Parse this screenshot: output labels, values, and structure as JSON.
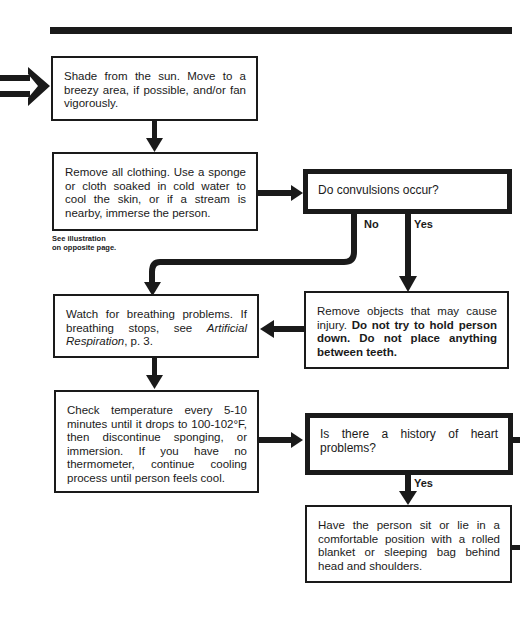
{
  "diagram": {
    "type": "flowchart",
    "topic": "Heat stroke first aid",
    "steps": {
      "shade": "Shade from the sun. Move to a breezy area, if possible, and/or fan vigorously.",
      "remove_clothing": "Remove all clothing. Use a sponge or cloth soaked in cold water to cool the skin, or if a stream is nearby, immerse the person.",
      "illustration_note_line1": "See illustration",
      "illustration_note_line2": "on opposite page.",
      "convulsions_question": "Do convulsions occur?",
      "no_label": "No",
      "yes_label": "Yes",
      "watch_breathing_prefix": "Watch for breathing problems. If breathing stops, see ",
      "watch_breathing_ref": "Artificial Respiration",
      "watch_breathing_suffix": ", p. 3.",
      "remove_objects_prefix": "Remove objects that may cause injury. ",
      "remove_objects_bold": "Do not try to hold person down. Do not place anything between teeth.",
      "check_temperature": "Check temperature every 5-10 minutes until it drops to 100-102°F, then discontinue sponging, or immersion. If you have no thermometer, continue cooling process until person feels cool.",
      "heart_question": "Is there a history of heart problems?",
      "heart_yes_label": "Yes",
      "sit_or_lie": "Have the person sit or lie in a comfortable position with a rolled blanket or sleeping bag behind head and shoulders."
    },
    "edges": [
      {
        "from": "incoming",
        "to": "shade"
      },
      {
        "from": "shade",
        "to": "remove_clothing"
      },
      {
        "from": "remove_clothing",
        "to": "convulsions_question"
      },
      {
        "from": "convulsions_question",
        "to": "watch_breathing",
        "label": "No"
      },
      {
        "from": "convulsions_question",
        "to": "remove_objects",
        "label": "Yes"
      },
      {
        "from": "remove_objects",
        "to": "watch_breathing"
      },
      {
        "from": "watch_breathing",
        "to": "check_temperature"
      },
      {
        "from": "check_temperature",
        "to": "heart_question"
      },
      {
        "from": "heart_question",
        "to": "sit_or_lie",
        "label": "Yes"
      },
      {
        "from": "heart_question",
        "to": "offpage_right"
      },
      {
        "from": "sit_or_lie",
        "to": "offpage_right"
      }
    ],
    "colors": {
      "ink": "#1a1a1a",
      "paper": "#ffffff"
    }
  }
}
